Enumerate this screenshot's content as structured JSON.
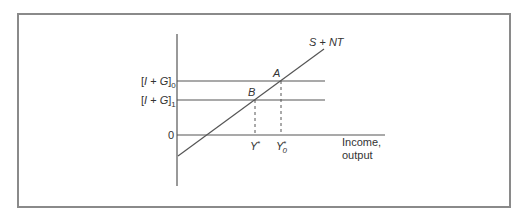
{
  "diagram": {
    "type": "economics-equilibrium",
    "curve": {
      "label": "S + NT",
      "label_parts": {
        "s": "S",
        "plus": " + ",
        "nt": "NT"
      }
    },
    "y_axis_levels": [
      {
        "name": "investment-plus-government-0",
        "bracket": "[I + G]",
        "subscript": "0"
      },
      {
        "name": "investment-plus-government-1",
        "bracket": "[I + G]",
        "subscript": "1"
      },
      {
        "name": "zero",
        "label": "0"
      }
    ],
    "points": [
      {
        "label": "A"
      },
      {
        "label": "B"
      }
    ],
    "x_markers": [
      {
        "label": "Y*",
        "base": "Y",
        "sup": "*"
      },
      {
        "label": "Y0*",
        "base": "Y",
        "sup": "*",
        "sub": "0"
      }
    ],
    "x_axis_label": {
      "line1": "Income,",
      "line2": "output"
    },
    "colors": {
      "line": "#555555",
      "frame": "#8a8a8a",
      "text": "#333333"
    }
  }
}
